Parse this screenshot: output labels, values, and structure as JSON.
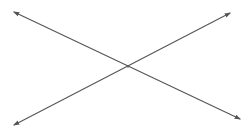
{
  "diagram": {
    "type": "intersecting-lines",
    "line_color": "#555555",
    "background": "#ffffff",
    "lines": [
      {
        "name": "line-descending",
        "x1": 14,
        "y1": 12,
        "x2": 240,
        "y2": 119,
        "arrows": "both"
      },
      {
        "name": "line-ascending",
        "x1": 14,
        "y1": 125,
        "x2": 230,
        "y2": 13,
        "arrows": "both"
      }
    ],
    "intersection": {
      "x": 128,
      "y": 67
    },
    "cutoff_text": ""
  }
}
